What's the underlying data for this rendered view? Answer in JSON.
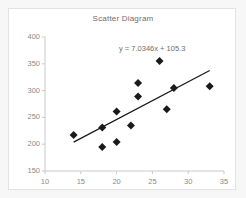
{
  "chart_data": {
    "type": "scatter",
    "title": "Scatter Diagram",
    "xlabel": "",
    "ylabel": "",
    "xlim": [
      10,
      35
    ],
    "ylim": [
      150,
      400
    ],
    "xticks": [
      10,
      15,
      20,
      25,
      30,
      35
    ],
    "yticks": [
      150,
      200,
      250,
      300,
      350,
      400
    ],
    "grid": false,
    "legend": false,
    "annotations": [
      {
        "text": "y = 7.0346x + 105.3",
        "x": 24.5,
        "y": 372
      }
    ],
    "trendline": {
      "equation": "y = 7.0346x + 105.3",
      "slope": 7.0346,
      "intercept": 105.3,
      "x_start": 14,
      "x_end": 33
    },
    "points": [
      {
        "x": 14,
        "y": 217
      },
      {
        "x": 18,
        "y": 231
      },
      {
        "x": 18,
        "y": 195
      },
      {
        "x": 20,
        "y": 261
      },
      {
        "x": 20,
        "y": 204
      },
      {
        "x": 22,
        "y": 235
      },
      {
        "x": 23,
        "y": 314
      },
      {
        "x": 23,
        "y": 289
      },
      {
        "x": 26,
        "y": 355
      },
      {
        "x": 27,
        "y": 265
      },
      {
        "x": 28,
        "y": 305
      },
      {
        "x": 33,
        "y": 308
      }
    ],
    "marker": {
      "shape": "diamond",
      "color": "#1a1a1a",
      "size": 4
    },
    "line_color": "#1a1a1a",
    "axis_color": "#c9c9c9",
    "text_color": "#7d7d7d"
  }
}
